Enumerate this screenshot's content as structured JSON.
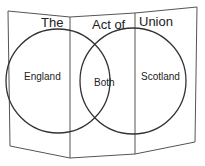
{
  "diagram": {
    "type": "venn-foldable",
    "title_words": [
      "The",
      "Act of",
      "Union"
    ],
    "sets": [
      {
        "label": "England"
      },
      {
        "label": "Both"
      },
      {
        "label": "Scotland"
      }
    ],
    "colors": {
      "stroke": "#333333",
      "text": "#222222",
      "background": "#ffffff"
    }
  }
}
